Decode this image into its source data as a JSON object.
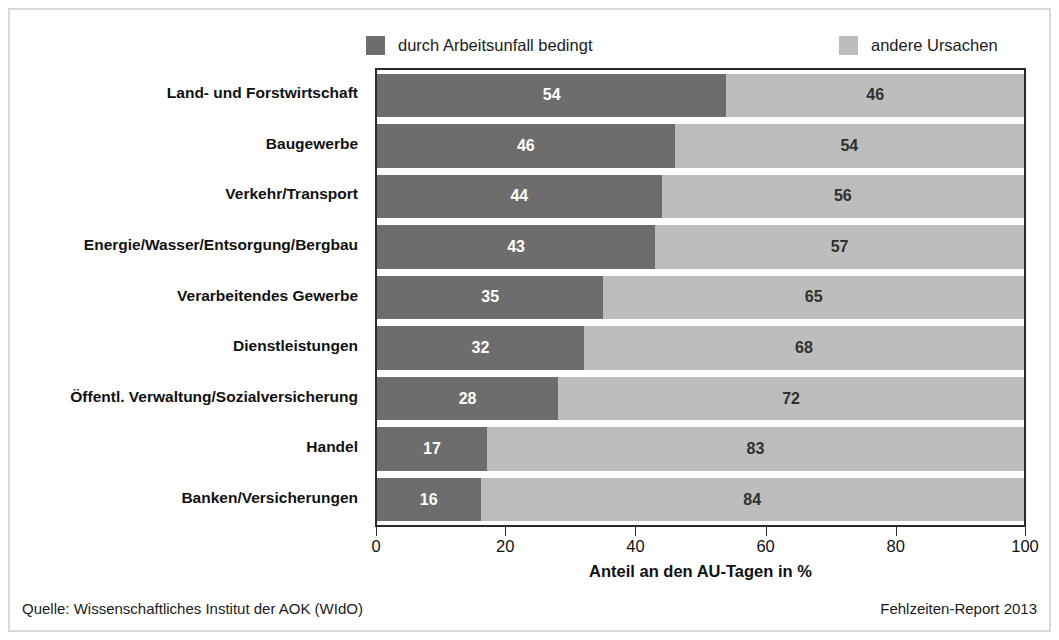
{
  "chart_data": {
    "type": "bar",
    "orientation": "horizontal",
    "stacked": true,
    "normalized_percent": true,
    "title": "",
    "subtitle": "",
    "xlabel": "Anteil an den AU-Tagen in %",
    "ylabel": "",
    "xlim": [
      0,
      100
    ],
    "xticks": [
      0,
      20,
      40,
      60,
      80,
      100
    ],
    "xtick_labels": [
      "0",
      "20",
      "40",
      "60",
      "80",
      "100"
    ],
    "grid": false,
    "legend_position": "top",
    "categories": [
      "Land- und Forstwirtschaft",
      "Baugewerbe",
      "Verkehr/Transport",
      "Energie/Wasser/Entsorgung/Bergbau",
      "Verarbeitendes Gewerbe",
      "Dienstleistungen",
      "Öffentl. Verwaltung/Sozialversicherung",
      "Handel",
      "Banken/Versicherungen"
    ],
    "series": [
      {
        "name": "durch Arbeitsunfall bedingt",
        "color": "#6d6d6d",
        "values": [
          54,
          46,
          44,
          43,
          35,
          32,
          28,
          17,
          16
        ]
      },
      {
        "name": "andere Ursachen",
        "color": "#bdbdbd",
        "values": [
          46,
          54,
          56,
          57,
          65,
          68,
          72,
          83,
          84
        ]
      }
    ]
  },
  "legend": {
    "entries": [
      {
        "label": "durch Arbeitsunfall bedingt",
        "color": "#6d6d6d"
      },
      {
        "label": "andere Ursachen",
        "color": "#bdbdbd"
      }
    ]
  },
  "axis": {
    "title": "Anteil an den AU-Tagen in %",
    "ticks": [
      "0",
      "20",
      "40",
      "60",
      "80",
      "100"
    ]
  },
  "footer": {
    "source": "Quelle: Wissenschaftliches Institut der AOK (WIdO)",
    "report": "Fehlzeiten-Report 2013"
  },
  "colors": {
    "series_dark": "#6d6d6d",
    "series_light": "#bdbdbd",
    "frame": "#2b2b2b",
    "outer_border": "#d9d9d9",
    "text": "#111111"
  }
}
